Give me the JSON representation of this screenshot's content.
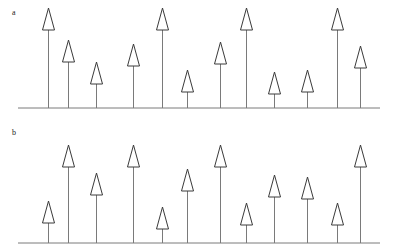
{
  "figure": {
    "width": 394,
    "height": 250,
    "background": "#ffffff",
    "stroke_color": "#3a3a3a",
    "baseline_color": "#7a7a7a",
    "text_color": "#1a1a1a"
  },
  "panels": [
    {
      "id": "a",
      "label": "a",
      "label_x": 12,
      "label_y": 16,
      "baseline_y": 108,
      "baseline_x1": 18,
      "baseline_x2": 380,
      "arrow_half_width": 6,
      "arrow_head_height": 22
    },
    {
      "id": "b",
      "label": "b",
      "label_x": 12,
      "label_y": 136,
      "baseline_y": 243,
      "baseline_x1": 18,
      "baseline_x2": 380,
      "arrow_half_width": 6,
      "arrow_head_height": 22
    }
  ],
  "chart_data": {
    "type": "bar",
    "title": "",
    "subtitle": "",
    "xlabel": "",
    "ylabel": "",
    "grid": false,
    "legend": null,
    "annotations": [
      "a",
      "b"
    ],
    "x": [
      48,
      68,
      96,
      133,
      162,
      187,
      220,
      246,
      274,
      307,
      337,
      360
    ],
    "categories": [
      "1",
      "2",
      "3",
      "4",
      "5",
      "6",
      "7",
      "8",
      "9",
      "10",
      "11",
      "12"
    ],
    "ylim": [
      0,
      105
    ],
    "series": [
      {
        "name": "a",
        "values": [
          100,
          68,
          46,
          64,
          100,
          38,
          66,
          100,
          36,
          38,
          100,
          62
        ]
      },
      {
        "name": "b",
        "values": [
          42,
          98,
          70,
          98,
          36,
          74,
          98,
          40,
          68,
          66,
          40,
          98
        ]
      }
    ]
  }
}
